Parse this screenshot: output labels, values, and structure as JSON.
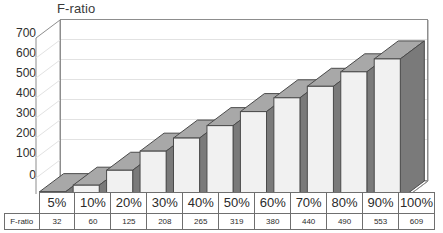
{
  "chart_data": {
    "type": "bar",
    "title": "F-ratio",
    "xlabel": "",
    "ylabel": "",
    "categories": [
      "5%",
      "10%",
      "20%",
      "30%",
      "40%",
      "50%",
      "60%",
      "70%",
      "80%",
      "90%",
      "100%"
    ],
    "values": [
      32,
      60,
      125,
      208,
      265,
      319,
      380,
      440,
      490,
      553,
      609
    ],
    "series": [
      {
        "name": "F-ratio",
        "values": [
          32,
          60,
          125,
          208,
          265,
          319,
          380,
          440,
          490,
          553,
          609
        ]
      }
    ],
    "ylim": [
      0,
      700
    ],
    "yticks": [
      0,
      100,
      200,
      300,
      400,
      500,
      600,
      700
    ],
    "ytick_labels": [
      "0",
      "100",
      "200",
      "300",
      "400",
      "500",
      "600",
      "700"
    ],
    "grid": true,
    "legend": false,
    "style": "3d-column",
    "table": {
      "row_label": "F-ratio",
      "header": [
        "5%",
        "10%",
        "20%",
        "30%",
        "40%",
        "50%",
        "60%",
        "70%",
        "80%",
        "90%",
        "100%"
      ],
      "values": [
        "32",
        "60",
        "125",
        "208",
        "265",
        "319",
        "380",
        "440",
        "490",
        "553",
        "609"
      ]
    }
  },
  "colors": {
    "bar_front": "#f1f1f1",
    "bar_top": "#a8a8a8",
    "bar_side": "#7a7a7a",
    "bar_outline": "#4a4a4a",
    "gridline": "#e2e2e2",
    "axis": "#8d8d8d",
    "text": "#2b2b2b",
    "background": "#ffffff"
  }
}
